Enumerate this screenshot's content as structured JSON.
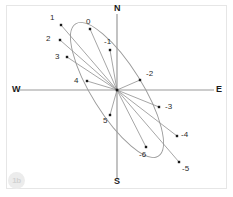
{
  "figure": {
    "background": "#ffffff",
    "frame_color": "#e6e6e6",
    "axis_color": "#9a9a9a",
    "curve_color": "#9a9a9a",
    "ray_color": "#8f8f8f",
    "point_color": "#1a1a1a",
    "label_color": "#2b2b2b"
  },
  "watermark": {
    "text": "1b"
  },
  "axes": {
    "north": "N",
    "south": "S",
    "east": "E",
    "west": "W"
  },
  "chart_data": {
    "type": "scatter",
    "title": "",
    "xlabel": "",
    "ylabel": "",
    "grid": false,
    "legend": false,
    "axis_labels": [
      "N",
      "E",
      "S",
      "W"
    ],
    "origin_px": [
      117,
      90
    ],
    "ellipse": {
      "center_px": [
        117,
        90
      ],
      "semi_major_px": 78,
      "semi_minor_px": 25,
      "rotation_deg": 58
    },
    "labels": [
      "1",
      "0",
      "-1",
      "2",
      "3",
      "4",
      "-2",
      "5",
      "-3",
      "-4",
      "-6",
      "-5"
    ],
    "points_px": [
      {
        "label": "1",
        "x": 61,
        "y": 25,
        "lx": 50,
        "ly": 14
      },
      {
        "label": "0",
        "x": 90,
        "y": 29,
        "lx": 86,
        "ly": 18
      },
      {
        "label": "-1",
        "x": 110,
        "y": 50,
        "lx": 104,
        "ly": 38
      },
      {
        "label": "2",
        "x": 60,
        "y": 40,
        "lx": 46,
        "ly": 35
      },
      {
        "label": "3",
        "x": 67,
        "y": 57,
        "lx": 55,
        "ly": 53
      },
      {
        "label": "4",
        "x": 87,
        "y": 81,
        "lx": 74,
        "ly": 77
      },
      {
        "label": "-2",
        "x": 140,
        "y": 80,
        "lx": 146,
        "ly": 70
      },
      {
        "label": "5",
        "x": 110,
        "y": 115,
        "lx": 103,
        "ly": 117
      },
      {
        "label": "-3",
        "x": 159,
        "y": 107,
        "lx": 165,
        "ly": 103
      },
      {
        "label": "-4",
        "x": 177,
        "y": 136,
        "lx": 181,
        "ly": 131
      },
      {
        "label": "-6",
        "x": 146,
        "y": 147,
        "lx": 139,
        "ly": 151
      },
      {
        "label": "-5",
        "x": 179,
        "y": 162,
        "lx": 182,
        "ly": 165
      }
    ]
  }
}
